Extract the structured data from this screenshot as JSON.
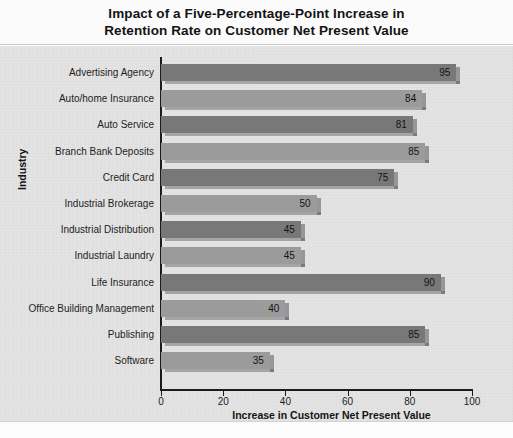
{
  "chart_data": {
    "type": "bar",
    "orientation": "horizontal",
    "title": "Impact of a Five-Percentage-Point Increase in Retention Rate on Customer Net Present Value",
    "title_line1": "Impact of a Five-Percentage-Point Increase in",
    "title_line2": "Retention Rate on Customer Net Present Value",
    "xlabel": "Increase in Customer Net Present Value",
    "ylabel": "Industry",
    "xlim": [
      0,
      100
    ],
    "xticks": [
      0,
      20,
      40,
      60,
      80,
      100
    ],
    "grid": false,
    "legend": "none",
    "categories": [
      "Advertising Agency",
      "Auto/home Insurance",
      "Auto Service",
      "Branch Bank Deposits",
      "Credit Card",
      "Industrial Brokerage",
      "Industrial Distribution",
      "Industrial Laundry",
      "Life Insurance",
      "Office Building Management",
      "Publishing",
      "Software"
    ],
    "values": [
      95,
      84,
      81,
      85,
      75,
      50,
      45,
      45,
      90,
      40,
      85,
      35
    ],
    "bar_colors": [
      "#787878",
      "#9b9b9b",
      "#787878",
      "#9b9b9b",
      "#787878",
      "#9b9b9b",
      "#787878",
      "#9b9b9b",
      "#787878",
      "#9b9b9b",
      "#787878",
      "#9b9b9b"
    ],
    "colors": {
      "bar_dark": "#787878",
      "bar_light": "#9b9b9b",
      "plot_background": "#e3e3e3",
      "axis": "#1b1b1b",
      "text": "#1d1d1d",
      "title_band": "#fbfbfb"
    }
  }
}
